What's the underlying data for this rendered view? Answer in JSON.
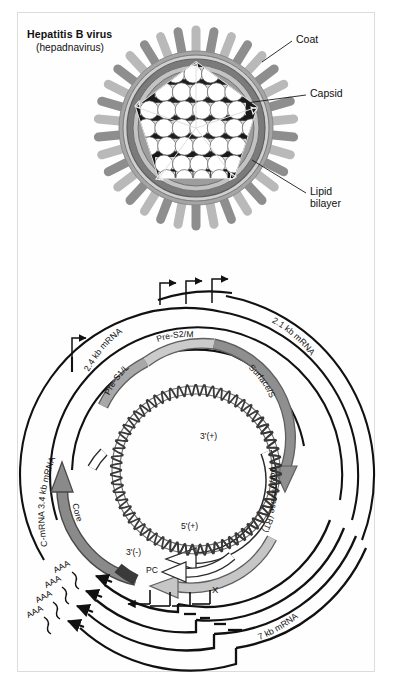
{
  "figure": {
    "domain": "scientific-illustration",
    "panels": [
      "virion-structure",
      "genome-transcript-map"
    ]
  },
  "virion": {
    "title_line1": "Hepatitis B virus",
    "title_line2": "(hepadnavirus)",
    "callouts": [
      {
        "id": "coat",
        "label": "Coat"
      },
      {
        "id": "capsid",
        "label": "Capsid"
      },
      {
        "id": "lipid",
        "label_line1": "Lipid",
        "label_line2": "bilayer"
      }
    ],
    "structure": {
      "spike_count": 34,
      "capsomere_count": 42,
      "capsid_shape": "pentagonal"
    },
    "colors": {
      "spike_light": "#b9b9b9",
      "spike_dark": "#8e8e8e",
      "envelope_outer": "#9a9a9a",
      "envelope_mid": "#6f6f6f",
      "envelope_inner": "#b3b3b3",
      "capsid_interior": "#1a1a1a",
      "capsomere": "#ffffff",
      "capsomere_edge": "#555555"
    }
  },
  "genome": {
    "orfs": [
      {
        "id": "pre-s1-l",
        "label": "Pre-S1/L",
        "fill": "#a8a8a8"
      },
      {
        "id": "pre-s2-m",
        "label": "Pre-S2/M",
        "fill": "#c9c9c9"
      },
      {
        "id": "surface-s",
        "label": "Surface/S",
        "fill": "#8f8f8f"
      },
      {
        "id": "polymerase",
        "label": "Polymerase (RT)",
        "fill": "#ffffff"
      },
      {
        "id": "core",
        "label": "Core",
        "fill": "#8a8a8a"
      },
      {
        "id": "pre-core",
        "label": "PC",
        "fill": "#5a5a5a"
      },
      {
        "id": "x",
        "label": "X",
        "fill": "#c0c0c0"
      }
    ],
    "dna_labels": [
      {
        "id": "three-prime-plus",
        "label": "3'(+)"
      },
      {
        "id": "five-prime-plus",
        "label": "5'(+)"
      },
      {
        "id": "three-prime-minus",
        "label": "3'(-)"
      }
    ],
    "transcripts": [
      {
        "id": "mrna-2-4",
        "label": "2.4 kb mRNA"
      },
      {
        "id": "mrna-2-1",
        "label": "2.1 kb mRNA"
      },
      {
        "id": "mrna-3-4",
        "label": "C-mRNA  3.4 kb mRNA"
      },
      {
        "id": "mrna-7",
        "label": "7 kb mRNA"
      }
    ],
    "polya_tails": [
      "AAA",
      "AAA",
      "AAA",
      "AAA"
    ],
    "promoter_arrow_groups": [
      {
        "id": "top-promoters",
        "count": 3
      },
      {
        "id": "bottom-promoters",
        "count": 4
      },
      {
        "id": "left-promoter",
        "count": 1
      }
    ]
  }
}
